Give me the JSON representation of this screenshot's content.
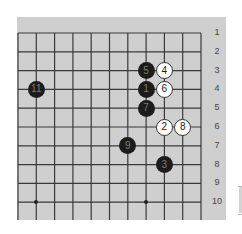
{
  "board": {
    "columns": 11,
    "visible_rows": 10,
    "row_labels": [
      "1",
      "2",
      "3",
      "4",
      "5",
      "6",
      "7",
      "8",
      "9",
      "10"
    ],
    "colors": {
      "background": "#cfcfcf",
      "line": "#3a3a3a",
      "black": "#1c1c1c",
      "white": "#ffffff"
    },
    "stones": [
      {
        "color": "black",
        "label": "1",
        "col": 8,
        "row": 4
      },
      {
        "color": "white",
        "label": "2",
        "col": 9,
        "row": 6
      },
      {
        "color": "black",
        "label": "3",
        "col": 9,
        "row": 8
      },
      {
        "color": "white",
        "label": "4",
        "col": 9,
        "row": 3
      },
      {
        "color": "black",
        "label": "5",
        "col": 8,
        "row": 3
      },
      {
        "color": "white",
        "label": "6",
        "col": 9,
        "row": 4
      },
      {
        "color": "black",
        "label": "7",
        "col": 8,
        "row": 5
      },
      {
        "color": "white",
        "label": "8",
        "col": 10,
        "row": 6
      },
      {
        "color": "black",
        "label": "9",
        "col": 7,
        "row": 7
      },
      {
        "color": "black",
        "label": "11",
        "col": 2,
        "row": 4
      }
    ],
    "star_points": [
      {
        "col": 2,
        "row": 10
      },
      {
        "col": 8,
        "row": 10
      }
    ]
  }
}
